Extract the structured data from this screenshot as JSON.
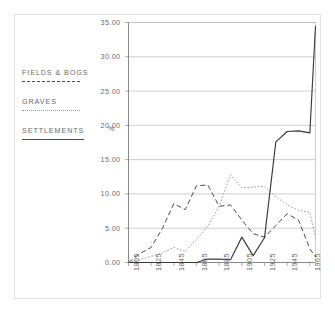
{
  "figure": {
    "unit_label": "%"
  },
  "legend": {
    "entries": [
      {
        "label": "FIELDS & BOGS",
        "style": "dashed"
      },
      {
        "label": "GRAVES",
        "style": "dotted"
      },
      {
        "label": "SETTLEMENTS",
        "style": "solid"
      }
    ]
  },
  "chart_data": {
    "type": "line",
    "title": "",
    "xlabel": "",
    "ylabel": "%",
    "xlim": [
      1805,
      1970
    ],
    "ylim": [
      0,
      35
    ],
    "grid": true,
    "legend_position": "left",
    "x_tick_labels": [
      "1805",
      "1825",
      "1845",
      "1865",
      "1885",
      "1905",
      "1925",
      "1945",
      "1965"
    ],
    "x_ticks": [
      1805,
      1825,
      1845,
      1865,
      1885,
      1905,
      1925,
      1945,
      1965
    ],
    "y_tick_labels": [
      "0.00",
      "5.00",
      "10.00",
      "15.00",
      "20.00",
      "25.00",
      "30.00",
      "35.00"
    ],
    "y_ticks": [
      0,
      5,
      10,
      15,
      20,
      25,
      30,
      35
    ],
    "x": [
      1805,
      1815,
      1825,
      1835,
      1845,
      1855,
      1865,
      1875,
      1885,
      1895,
      1905,
      1915,
      1925,
      1935,
      1945,
      1955,
      1965,
      1970
    ],
    "series": [
      {
        "name": "FIELDS & BOGS",
        "style": "dashed",
        "color": "#4a4a4a",
        "values": [
          0.0,
          1.3,
          2.2,
          5.0,
          8.6,
          7.7,
          11.2,
          11.3,
          8.2,
          8.4,
          6.2,
          4.2,
          3.7,
          5.4,
          7.1,
          6.2,
          2.0,
          0.8
        ]
      },
      {
        "name": "GRAVES",
        "style": "dotted",
        "color": "#9a9a9a",
        "values": [
          0.0,
          0.4,
          0.9,
          1.4,
          2.2,
          1.6,
          3.4,
          5.3,
          8.2,
          12.8,
          10.9,
          11.0,
          11.1,
          9.6,
          8.4,
          7.6,
          7.3,
          3.7
        ]
      },
      {
        "name": "SETTLEMENTS",
        "style": "solid",
        "color": "#3a3a3a",
        "values": [
          0.0,
          0.0,
          0.0,
          0.0,
          0.0,
          0.0,
          0.0,
          0.5,
          0.5,
          0.4,
          3.7,
          1.0,
          3.6,
          17.6,
          19.1,
          19.2,
          18.9,
          34.5
        ]
      }
    ]
  }
}
